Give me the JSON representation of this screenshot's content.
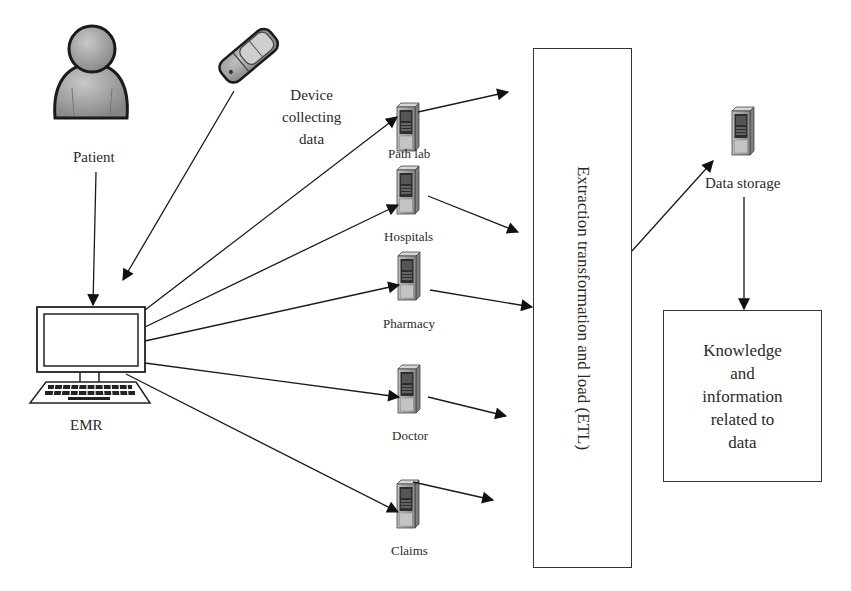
{
  "diagram": {
    "type": "healthcare data flow / ETL pipeline",
    "sources": [
      {
        "id": "patient",
        "label": "Patient",
        "icon": "person-icon"
      },
      {
        "id": "device",
        "label_lines": [
          "Device",
          "collecting",
          "data"
        ],
        "icon": "mobile-phone-icon"
      }
    ],
    "emr": {
      "label": "EMR",
      "icon": "desktop-computer-icon"
    },
    "servers": [
      {
        "id": "path-lab",
        "label": "Path lab",
        "icon": "server-icon"
      },
      {
        "id": "hospitals",
        "label": "Hospitals",
        "icon": "server-icon"
      },
      {
        "id": "pharmacy",
        "label": "Pharmacy",
        "icon": "server-icon"
      },
      {
        "id": "doctor",
        "label": "Doctor",
        "icon": "server-icon"
      },
      {
        "id": "claims",
        "label": "Claims",
        "icon": "server-icon"
      }
    ],
    "etl": {
      "label": "Extraction transformation and load (ETL)"
    },
    "storage": {
      "label": "Data storage",
      "icon": "server-icon"
    },
    "knowledge": {
      "label_lines": [
        "Knowledge",
        "and",
        "information",
        "related to",
        "data"
      ]
    },
    "edges": [
      {
        "from": "Patient",
        "to": "EMR"
      },
      {
        "from": "Device collecting data",
        "to": "EMR"
      },
      {
        "from": "EMR",
        "to": "Path lab"
      },
      {
        "from": "EMR",
        "to": "Hospitals"
      },
      {
        "from": "EMR",
        "to": "Pharmacy"
      },
      {
        "from": "EMR",
        "to": "Doctor"
      },
      {
        "from": "EMR",
        "to": "Claims"
      },
      {
        "from": "Path lab",
        "to": "ETL"
      },
      {
        "from": "Hospitals",
        "to": "ETL"
      },
      {
        "from": "Pharmacy",
        "to": "ETL"
      },
      {
        "from": "Doctor",
        "to": "ETL"
      },
      {
        "from": "Claims",
        "to": "ETL"
      },
      {
        "from": "ETL",
        "to": "Data storage"
      },
      {
        "from": "Data storage",
        "to": "Knowledge and information related to data"
      }
    ]
  },
  "colors": {
    "line": "#1a1a1a",
    "icon_fill": "#9a9a9a",
    "icon_dark": "#2b2b2b",
    "background": "#ffffff"
  }
}
